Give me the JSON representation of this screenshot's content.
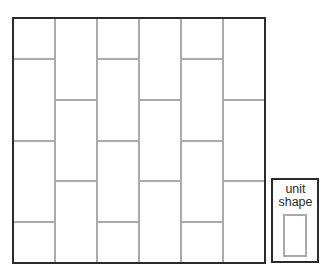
{
  "diagram": {
    "type": "tiling",
    "region": {
      "x": 13,
      "y": 18,
      "width": 252,
      "height": 245
    },
    "columns": 6,
    "column_width": 42,
    "column_boundaries_x": [
      13,
      55,
      97,
      139,
      181,
      223,
      265
    ],
    "odd_column_horizontal_lines_y": [
      59,
      141,
      222
    ],
    "even_column_horizontal_lines_y": [
      100,
      181
    ],
    "colors": {
      "outer_border": "#2b2b2b",
      "inner_lines": "#aaaaaa",
      "background": "#ffffff"
    }
  },
  "legend": {
    "label_line1": "unit",
    "label_line2": "shape",
    "box": {
      "x": 272,
      "y": 179,
      "width": 46,
      "height": 83
    },
    "unit_rect": {
      "x": 284,
      "y": 215,
      "width": 22,
      "height": 41
    }
  }
}
